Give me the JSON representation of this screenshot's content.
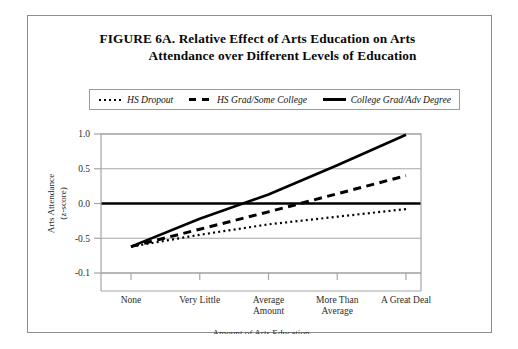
{
  "figure": {
    "title_line1": "FIGURE 6A.  Relative Effect of Arts Education on Arts",
    "title_line2": "Attendance over Different Levels of Education"
  },
  "legend": {
    "items": [
      {
        "label": "HS Dropout",
        "style": "dotted",
        "swatch_name": "legend-swatch-dotted"
      },
      {
        "label": "HS Grad/Some College",
        "style": "dashed",
        "swatch_name": "legend-swatch-dashed"
      },
      {
        "label": "College Grad/Adv Degree",
        "style": "solid",
        "swatch_name": "legend-swatch-solid"
      }
    ]
  },
  "chart_data": {
    "type": "line",
    "title": "FIGURE 6A.  Relative Effect of Arts Education on Arts Attendance over Different Levels of Education",
    "xlabel": "Amount of Arts Education",
    "ylabel": "Arts Attendance (z-score)",
    "ylabel_line1": "Arts Attendance",
    "ylabel_line2": "(z-score)",
    "categories": [
      "None",
      "Very Little",
      "Average Amount",
      "More Than Average",
      "A Great Deal"
    ],
    "category_labels": [
      [
        "None"
      ],
      [
        "Very Little"
      ],
      [
        "Average",
        "Amount"
      ],
      [
        "More Than",
        "Average"
      ],
      [
        "A Great Deal"
      ]
    ],
    "ytick_labels": [
      "1.0",
      "0.5",
      "0.0",
      "-0.5",
      "-0.1"
    ],
    "ytick_values": [
      1.0,
      0.5,
      0.0,
      -0.5,
      -1.0
    ],
    "ylim": [
      -1.0,
      1.0
    ],
    "grid": true,
    "zero_line": true,
    "legend_position": "top",
    "series": [
      {
        "name": "HS Dropout",
        "style": "dotted",
        "values": [
          -0.62,
          -0.45,
          -0.3,
          -0.19,
          -0.08
        ]
      },
      {
        "name": "HS Grad/Some College",
        "style": "dashed",
        "values": [
          -0.62,
          -0.37,
          -0.12,
          0.14,
          0.4
        ]
      },
      {
        "name": "College Grad/Adv Degree",
        "style": "solid",
        "values": [
          -0.62,
          -0.22,
          0.13,
          0.55,
          0.99
        ]
      }
    ]
  },
  "colors": {
    "line": "#000000",
    "grid": "#a6a6a6",
    "frame": "#8d8d8d",
    "text": "#111111"
  }
}
